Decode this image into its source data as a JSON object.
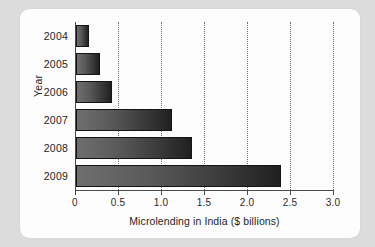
{
  "chart_data": {
    "type": "bar",
    "orientation": "horizontal",
    "title": "",
    "xlabel": "Microlending in India ($ billions)",
    "ylabel": "Year",
    "categories": [
      "2004",
      "2005",
      "2006",
      "2007",
      "2008",
      "2009"
    ],
    "values": [
      0.15,
      0.28,
      0.42,
      1.12,
      1.35,
      2.38
    ],
    "xlim": [
      0,
      3.0
    ],
    "xticks": [
      0,
      0.5,
      1.0,
      1.5,
      2.0,
      2.5,
      3.0
    ],
    "xtick_labels": [
      "0",
      "0.5",
      "1.0",
      "1.5",
      "2.0",
      "2.5",
      "3.0"
    ],
    "grid": "vertical-dotted",
    "legend": "none",
    "series": [
      {
        "name": "Microlending in India ($ billions)",
        "values": [
          0.15,
          0.28,
          0.42,
          1.12,
          1.35,
          2.38
        ]
      }
    ],
    "bar_color": "#3a3a3a",
    "bar_gradient_from": "#6f6f6f",
    "bar_gradient_to": "#202020",
    "background_color": "#fdfdfd",
    "page_background_color": "#dcdcdc"
  }
}
